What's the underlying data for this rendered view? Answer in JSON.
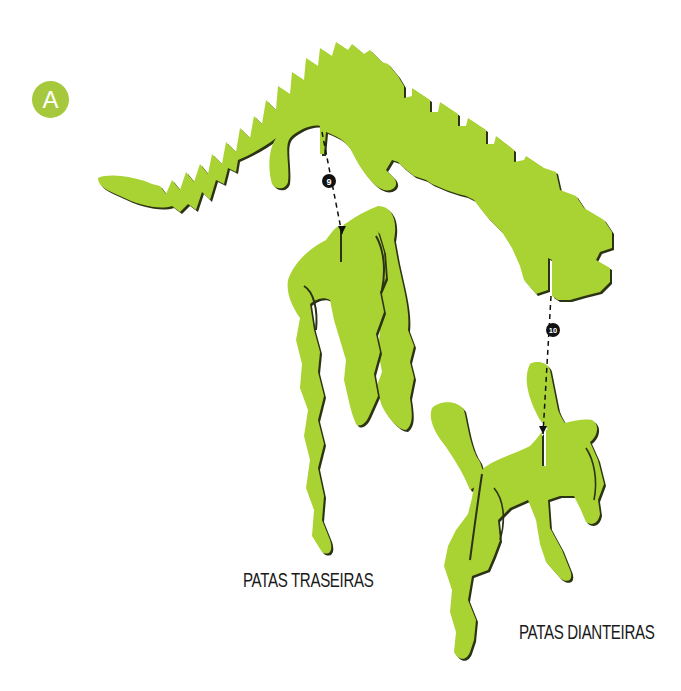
{
  "step": {
    "letter": "A",
    "badge_color": "#a6c83c"
  },
  "colors": {
    "piece_fill": "#a9d233",
    "piece_edge": "#2c3314",
    "guide_line": "#111111",
    "marker_fill": "#111111",
    "marker_text": "#ffffff",
    "background": "#ffffff"
  },
  "pieces": [
    {
      "id": "body",
      "name": "Corpo (espinha e cauda)"
    },
    {
      "id": "hind-legs",
      "name": "Patas traseiras"
    },
    {
      "id": "front-legs",
      "name": "Patas dianteiras"
    }
  ],
  "connectors": [
    {
      "number": "9",
      "from": "body-rear-slot",
      "to": "hind-legs-slot"
    },
    {
      "number": "10",
      "from": "body-front-slot",
      "to": "front-legs-slot"
    }
  ],
  "labels": {
    "hind_legs": "PATAS TRASEIRAS",
    "front_legs": "PATAS DIANTEIRAS"
  }
}
